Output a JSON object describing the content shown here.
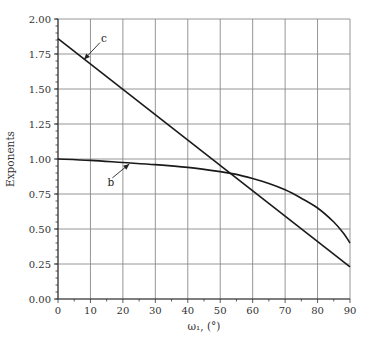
{
  "chart_data": {
    "type": "line",
    "title": "",
    "xlabel": "ω₁, (°)",
    "ylabel": "Exponents",
    "xlim": [
      0,
      90
    ],
    "ylim": [
      0,
      2.0
    ],
    "xticks": [
      0,
      10,
      20,
      30,
      40,
      50,
      60,
      70,
      80,
      90
    ],
    "xtick_labels": [
      "0",
      "10",
      "20",
      "30",
      "40",
      "50",
      "60",
      "70",
      "80",
      "90"
    ],
    "yticks": [
      0,
      0.25,
      0.5,
      0.75,
      1.0,
      1.25,
      1.5,
      1.75,
      2.0
    ],
    "ytick_labels": [
      "0.00",
      "0.25",
      "0.50",
      "0.75",
      "1.00",
      "1.25",
      "1.50",
      "1.75",
      "2.00"
    ],
    "x_minor_step": 5,
    "y_minor_step": 0.05,
    "grid": true,
    "legend": "none",
    "series": [
      {
        "name": "b",
        "x": [
          0,
          10,
          20,
          30,
          40,
          50,
          55,
          60,
          65,
          70,
          75,
          80,
          85,
          88,
          90
        ],
        "y": [
          1.0,
          0.99,
          0.975,
          0.96,
          0.94,
          0.91,
          0.89,
          0.86,
          0.825,
          0.78,
          0.72,
          0.65,
          0.55,
          0.47,
          0.4
        ]
      },
      {
        "name": "c",
        "x": [
          0,
          90
        ],
        "y": [
          1.86,
          0.23
        ]
      }
    ],
    "annotations": [
      {
        "text": "c",
        "points_to": {
          "x": 8,
          "y": 1.71
        },
        "series": "c"
      },
      {
        "text": "b",
        "points_to": {
          "x": 22,
          "y": 0.965
        },
        "series": "b"
      }
    ]
  }
}
